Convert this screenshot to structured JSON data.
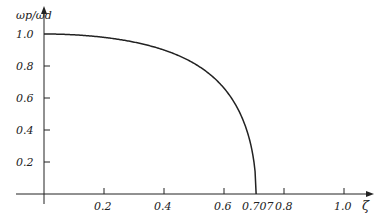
{
  "chart_data": {
    "type": "line",
    "title": "",
    "xlabel": "ζ",
    "ylabel": "ωp/ωd",
    "xticks": [
      "0.2",
      "0.4",
      "0.6",
      "0.707",
      "0.8",
      "1.0"
    ],
    "yticks": [
      "1.0",
      "0.8",
      "0.6",
      "0.4",
      "0.2"
    ],
    "xlim": [
      0,
      1.05
    ],
    "ylim": [
      0,
      1.05
    ],
    "grid": false,
    "series": [
      {
        "name": "ωp/ωd",
        "x": [
          0,
          0.1,
          0.2,
          0.3,
          0.4,
          0.5,
          0.55,
          0.6,
          0.65,
          0.68,
          0.7,
          0.707
        ],
        "values": [
          1.0,
          0.995,
          0.979,
          0.953,
          0.909,
          0.816,
          0.746,
          0.661,
          0.493,
          0.348,
          0.169,
          0.0
        ]
      }
    ]
  },
  "labels": {
    "ylabel": "ωp/ωd",
    "xlabel": "ζ",
    "x": [
      "0.2",
      "0.4",
      "0.6",
      "0.707",
      "0.8",
      "1.0"
    ],
    "y": [
      "1.0",
      "0.8",
      "0.6",
      "0.4",
      "0.2"
    ]
  }
}
